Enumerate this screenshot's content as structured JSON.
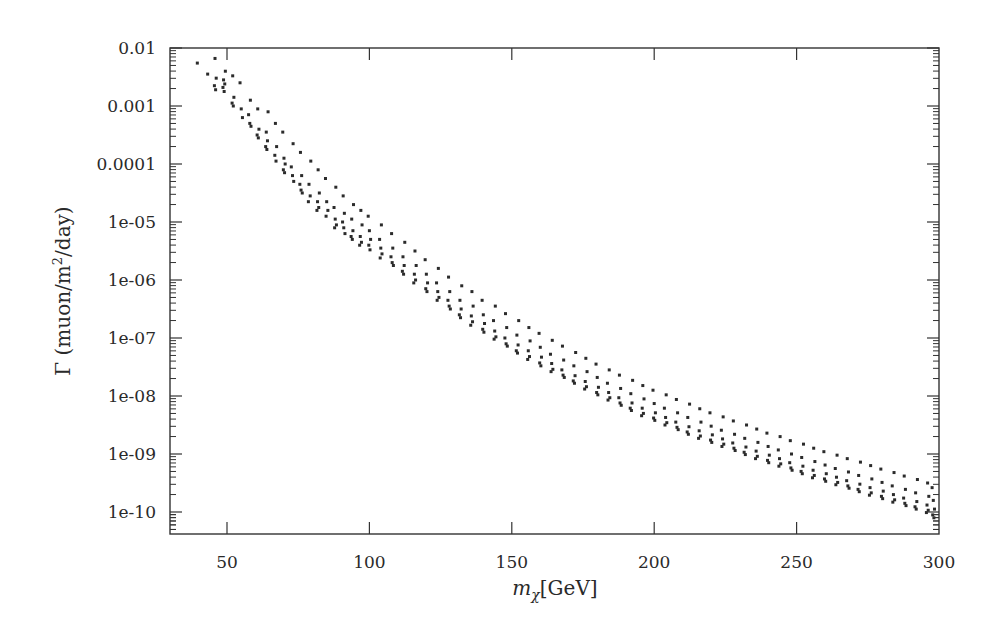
{
  "chart_data": {
    "type": "scatter",
    "title": "",
    "xlabel": "m_χ[GeV]",
    "ylabel": "Γ (muon/m²/day)",
    "xscale": "linear",
    "yscale": "log",
    "xlim": [
      30,
      300
    ],
    "ylim": [
      5e-11,
      0.01
    ],
    "grid": false,
    "legend": null,
    "x_ticks": [
      50,
      100,
      150,
      200,
      250,
      300
    ],
    "x_tick_labels": [
      "50",
      "100",
      "150",
      "200",
      "250",
      "300"
    ],
    "y_ticks": [
      0.01,
      0.001,
      0.0001,
      1e-05,
      1e-06,
      1e-07,
      1e-08,
      1e-09,
      1e-10
    ],
    "y_tick_labels": [
      "0.01",
      "0.001",
      "0.0001",
      "1e-05",
      "1e-06",
      "1e-07",
      "1e-08",
      "1e-09",
      "1e-10"
    ],
    "marker": {
      "shape": "square",
      "size": 3,
      "color": "#2b2b2b"
    },
    "series": [
      {
        "name": "Γ vs m_χ",
        "note": "points grouped in clusters of equal m_χ (log10 Γ values listed per cluster)",
        "clusters": [
          {
            "m": 40,
            "log10": [
              -2.26
            ]
          },
          {
            "m": 43,
            "log10": [
              -2.45
            ]
          },
          {
            "m": 46,
            "log10": [
              -2.18,
              -2.52,
              -2.65,
              -2.72
            ]
          },
          {
            "m": 49,
            "log10": [
              -2.4,
              -2.55,
              -2.62,
              -2.68,
              -2.75
            ]
          },
          {
            "m": 52,
            "log10": [
              -2.48,
              -2.85,
              -2.95,
              -3.0
            ]
          },
          {
            "m": 55,
            "log10": [
              -2.6,
              -3.05,
              -3.2
            ]
          },
          {
            "m": 58,
            "log10": [
              -2.9,
              -3.15,
              -3.3,
              -3.35
            ]
          },
          {
            "m": 61,
            "log10": [
              -3.05,
              -3.4,
              -3.5,
              -3.55
            ]
          },
          {
            "m": 64,
            "log10": [
              -3.1,
              -3.45,
              -3.6,
              -3.7,
              -3.75
            ]
          },
          {
            "m": 67,
            "log10": [
              -3.3,
              -3.7,
              -3.85,
              -3.95
            ]
          },
          {
            "m": 70,
            "log10": [
              -3.45,
              -3.9,
              -4.0,
              -4.1,
              -4.15
            ]
          },
          {
            "m": 73,
            "log10": [
              -3.65,
              -4.05,
              -4.2,
              -4.3
            ]
          },
          {
            "m": 76,
            "log10": [
              -3.8,
              -4.2,
              -4.35,
              -4.45,
              -4.5
            ]
          },
          {
            "m": 79,
            "log10": [
              -3.95,
              -4.35,
              -4.55,
              -4.65
            ]
          },
          {
            "m": 82,
            "log10": [
              -4.1,
              -4.5,
              -4.65,
              -4.75,
              -4.8
            ]
          },
          {
            "m": 85,
            "log10": [
              -4.25,
              -4.65,
              -4.8,
              -4.9
            ]
          },
          {
            "m": 88,
            "log10": [
              -4.4,
              -4.75,
              -4.95,
              -5.05,
              -5.1
            ]
          },
          {
            "m": 91,
            "log10": [
              -4.55,
              -4.85,
              -5.0,
              -5.1,
              -5.2
            ]
          },
          {
            "m": 94,
            "log10": [
              -4.7,
              -4.95,
              -5.15,
              -5.25,
              -5.3
            ]
          },
          {
            "m": 97,
            "log10": [
              -4.8,
              -5.05,
              -5.25,
              -5.35,
              -5.4
            ]
          },
          {
            "m": 100,
            "log10": [
              -4.9,
              -5.15,
              -5.3,
              -5.4,
              -5.48
            ]
          },
          {
            "m": 104,
            "log10": [
              -5.05,
              -5.3,
              -5.45,
              -5.55,
              -5.62
            ]
          },
          {
            "m": 108,
            "log10": [
              -5.2,
              -5.45,
              -5.6,
              -5.7,
              -5.75
            ]
          },
          {
            "m": 112,
            "log10": [
              -5.35,
              -5.6,
              -5.75,
              -5.85,
              -5.9
            ]
          },
          {
            "m": 116,
            "log10": [
              -5.5,
              -5.75,
              -5.9,
              -6.0,
              -6.05
            ]
          },
          {
            "m": 120,
            "log10": [
              -5.65,
              -5.9,
              -6.05,
              -6.15,
              -6.2
            ]
          },
          {
            "m": 124,
            "log10": [
              -5.8,
              -6.05,
              -6.2,
              -6.3,
              -6.35
            ]
          },
          {
            "m": 128,
            "log10": [
              -5.95,
              -6.2,
              -6.35,
              -6.45,
              -6.5
            ]
          },
          {
            "m": 132,
            "log10": [
              -6.1,
              -6.35,
              -6.5,
              -6.6,
              -6.65
            ]
          },
          {
            "m": 136,
            "log10": [
              -6.2,
              -6.45,
              -6.62,
              -6.72,
              -6.78
            ]
          },
          {
            "m": 140,
            "log10": [
              -6.35,
              -6.6,
              -6.75,
              -6.85,
              -6.9
            ]
          },
          {
            "m": 144,
            "log10": [
              -6.45,
              -6.7,
              -6.88,
              -6.98,
              -7.02
            ]
          },
          {
            "m": 148,
            "log10": [
              -6.58,
              -6.82,
              -7.0,
              -7.1,
              -7.14
            ]
          },
          {
            "m": 152,
            "log10": [
              -6.7,
              -6.95,
              -7.12,
              -7.22,
              -7.26
            ]
          },
          {
            "m": 156,
            "log10": [
              -6.82,
              -7.05,
              -7.22,
              -7.32,
              -7.37
            ]
          },
          {
            "m": 160,
            "log10": [
              -6.92,
              -7.16,
              -7.33,
              -7.43,
              -7.48
            ]
          },
          {
            "m": 164,
            "log10": [
              -7.04,
              -7.28,
              -7.44,
              -7.54,
              -7.58
            ]
          },
          {
            "m": 168,
            "log10": [
              -7.14,
              -7.38,
              -7.55,
              -7.64,
              -7.68
            ]
          },
          {
            "m": 172,
            "log10": [
              -7.25,
              -7.48,
              -7.65,
              -7.74,
              -7.78
            ]
          },
          {
            "m": 176,
            "log10": [
              -7.35,
              -7.58,
              -7.75,
              -7.84,
              -7.88
            ]
          },
          {
            "m": 180,
            "log10": [
              -7.45,
              -7.68,
              -7.85,
              -7.94,
              -7.98
            ]
          },
          {
            "m": 184,
            "log10": [
              -7.55,
              -7.78,
              -7.94,
              -8.03,
              -8.07
            ]
          },
          {
            "m": 188,
            "log10": [
              -7.64,
              -7.87,
              -8.03,
              -8.12,
              -8.16
            ]
          },
          {
            "m": 192,
            "log10": [
              -7.73,
              -7.96,
              -8.12,
              -8.21,
              -8.25
            ]
          },
          {
            "m": 196,
            "log10": [
              -7.82,
              -8.05,
              -8.21,
              -8.3,
              -8.34
            ]
          },
          {
            "m": 200,
            "log10": [
              -7.9,
              -8.13,
              -8.29,
              -8.38,
              -8.42
            ]
          },
          {
            "m": 204,
            "log10": [
              -7.98,
              -8.21,
              -8.37,
              -8.46,
              -8.5
            ]
          },
          {
            "m": 208,
            "log10": [
              -8.06,
              -8.29,
              -8.45,
              -8.54,
              -8.58
            ]
          },
          {
            "m": 212,
            "log10": [
              -8.14,
              -8.37,
              -8.53,
              -8.62,
              -8.66
            ]
          },
          {
            "m": 216,
            "log10": [
              -8.22,
              -8.45,
              -8.6,
              -8.69,
              -8.73
            ]
          },
          {
            "m": 220,
            "log10": [
              -8.29,
              -8.52,
              -8.67,
              -8.76,
              -8.8
            ]
          },
          {
            "m": 224,
            "log10": [
              -8.36,
              -8.59,
              -8.74,
              -8.83,
              -8.87
            ]
          },
          {
            "m": 228,
            "log10": [
              -8.43,
              -8.66,
              -8.81,
              -8.9,
              -8.94
            ]
          },
          {
            "m": 232,
            "log10": [
              -8.5,
              -8.73,
              -8.88,
              -8.97,
              -9.01
            ]
          },
          {
            "m": 236,
            "log10": [
              -8.57,
              -8.8,
              -8.95,
              -9.04,
              -9.08
            ]
          },
          {
            "m": 240,
            "log10": [
              -8.64,
              -8.87,
              -9.02,
              -9.11,
              -9.15
            ]
          },
          {
            "m": 244,
            "log10": [
              -8.7,
              -8.93,
              -9.08,
              -9.17,
              -9.21
            ]
          },
          {
            "m": 248,
            "log10": [
              -8.77,
              -9.0,
              -9.15,
              -9.24,
              -9.28
            ]
          },
          {
            "m": 252,
            "log10": [
              -8.83,
              -9.06,
              -9.21,
              -9.3,
              -9.34
            ]
          },
          {
            "m": 256,
            "log10": [
              -8.9,
              -9.13,
              -9.28,
              -9.37,
              -9.41
            ]
          },
          {
            "m": 260,
            "log10": [
              -8.96,
              -9.19,
              -9.34,
              -9.43,
              -9.47
            ]
          },
          {
            "m": 264,
            "log10": [
              -9.02,
              -9.25,
              -9.4,
              -9.49,
              -9.53
            ]
          },
          {
            "m": 268,
            "log10": [
              -9.08,
              -9.31,
              -9.46,
              -9.55,
              -9.59
            ]
          },
          {
            "m": 272,
            "log10": [
              -9.14,
              -9.37,
              -9.52,
              -9.61,
              -9.65
            ]
          },
          {
            "m": 276,
            "log10": [
              -9.2,
              -9.43,
              -9.58,
              -9.67,
              -9.71
            ]
          },
          {
            "m": 280,
            "log10": [
              -9.26,
              -9.49,
              -9.64,
              -9.73,
              -9.77
            ]
          },
          {
            "m": 284,
            "log10": [
              -9.32,
              -9.55,
              -9.7,
              -9.79,
              -9.83
            ]
          },
          {
            "m": 288,
            "log10": [
              -9.38,
              -9.61,
              -9.76,
              -9.85,
              -9.89
            ]
          },
          {
            "m": 292,
            "log10": [
              -9.44,
              -9.67,
              -9.82,
              -9.91,
              -9.95
            ]
          },
          {
            "m": 296,
            "log10": [
              -9.5,
              -9.73,
              -9.88,
              -9.97,
              -10.01
            ]
          },
          {
            "m": 298,
            "log10": [
              -9.58,
              -9.8,
              -9.95,
              -10.05,
              -10.1
            ]
          }
        ]
      }
    ]
  },
  "layout": {
    "plot_left": 170,
    "plot_right": 939,
    "plot_top": 48,
    "plot_bottom": 534
  }
}
